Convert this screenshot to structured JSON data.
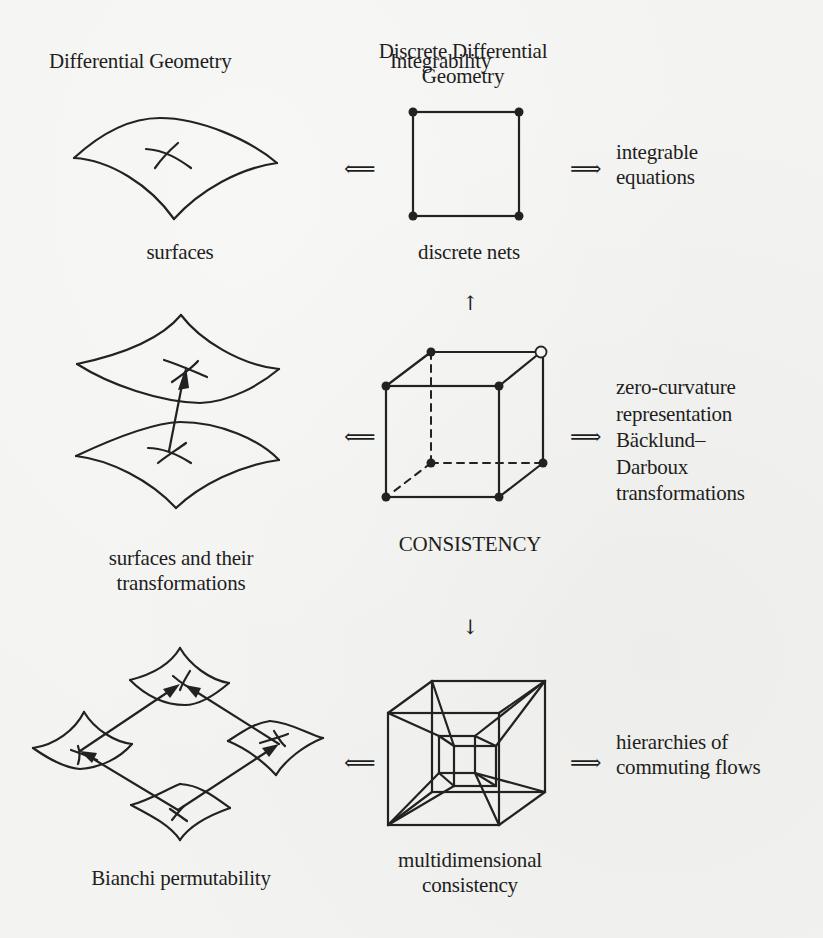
{
  "columns": {
    "left": "Differential Geometry",
    "middle_line1": "Discrete Differential",
    "middle_line2": "Geometry",
    "right": "Integrability"
  },
  "rows": [
    {
      "left_label": [
        "surfaces"
      ],
      "middle_label": [
        "discrete nets"
      ],
      "right_label": [
        "integrable",
        "equations"
      ],
      "left_arrow": "⟸",
      "right_arrow": "⟹",
      "left_figure": "surface-patch",
      "middle_figure": "square-net"
    },
    {
      "left_label": [
        "surfaces and their",
        "transformations"
      ],
      "middle_label": [
        "CONSISTENCY"
      ],
      "right_label": [
        "zero-curvature",
        "representation",
        "Bäcklund–",
        "Darboux",
        "transformations"
      ],
      "left_arrow": "⟸",
      "right_arrow": "⟹",
      "left_figure": "two-surfaces-with-transformation-arrow",
      "middle_figure": "cube-with-open-vertex"
    },
    {
      "left_label": [
        "Bianchi permutability"
      ],
      "middle_label": [
        "multidimensional",
        "consistency"
      ],
      "right_label": [
        "hierarchies of",
        "commuting flows"
      ],
      "left_arrow": "⟸",
      "right_arrow": "⟹",
      "left_figure": "bianchi-four-surfaces",
      "middle_figure": "tesseract"
    }
  ],
  "vertical_arrows": {
    "up": "↑",
    "down": "↓"
  }
}
